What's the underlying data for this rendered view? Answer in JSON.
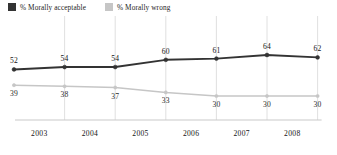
{
  "legend": {
    "items": [
      {
        "label": "% Morally acceptable",
        "color": "#333333",
        "key": "acceptable"
      },
      {
        "label": "% Morally wrong",
        "color": "#c6c6c6",
        "key": "wrong"
      }
    ]
  },
  "axis": {
    "tick_labels": [
      "2003",
      "2004",
      "2005",
      "2006",
      "2007",
      "2008"
    ]
  },
  "chart_data": {
    "type": "line",
    "title": "",
    "subtitle": "",
    "xlabel": "",
    "ylabel": "",
    "grid": true,
    "grid_orientation": "vertical",
    "legend_position": "top-left",
    "ylim": [
      0,
      100
    ],
    "x": [
      "2002",
      "2003",
      "2004",
      "2005",
      "2006",
      "2007",
      "2008"
    ],
    "tick_labels": [
      "2003",
      "2004",
      "2005",
      "2006",
      "2007",
      "2008"
    ],
    "series": [
      {
        "name": "% Morally acceptable",
        "color": "#333333",
        "values": [
          52,
          54,
          54,
          60,
          61,
          64,
          62
        ],
        "labels": [
          "52",
          "54",
          "54",
          "60",
          "61",
          "64",
          "62"
        ]
      },
      {
        "name": "% Morally wrong",
        "color": "#c6c6c6",
        "values": [
          39,
          38,
          37,
          33,
          30,
          30,
          30
        ],
        "labels": [
          "39",
          "38",
          "37",
          "33",
          "30",
          "30",
          "30"
        ]
      }
    ]
  }
}
